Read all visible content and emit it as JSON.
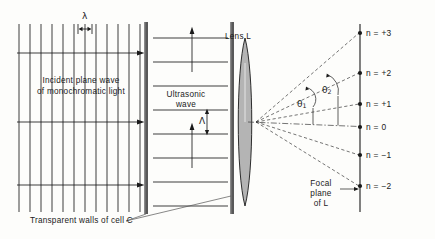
{
  "figure": {
    "background_color": "#fdfdfb",
    "ink_color": "#1a1a1a",
    "wall_color": "#555555",
    "lens_fill": "#b0b0b0"
  },
  "labels": {
    "light_wavelength": "λ",
    "incident_line1": "Incident plane wave",
    "incident_line2": "of monochromatic light",
    "ultrasonic_line1": "Ultrasonic",
    "ultrasonic_line2": "wave",
    "sound_wavelength": "Λ",
    "lens": "Lens L",
    "cell_walls": "Transparent walls of cell C",
    "focal_plane_line1": "Focal",
    "focal_plane_line2": "plane",
    "focal_plane_line3": "of L",
    "theta1": "θ",
    "theta1_sub": "1",
    "theta2": "θ",
    "theta2_sub": "2"
  },
  "diffraction_orders": [
    {
      "label": "n = +3",
      "order": 3,
      "y": 33
    },
    {
      "label": "n = +2",
      "order": 2,
      "y": 73
    },
    {
      "label": "n = +1",
      "order": 1,
      "y": 104
    },
    {
      "label": "n = 0",
      "order": 0,
      "y": 127
    },
    {
      "label": "n = −1",
      "order": -1,
      "y": 155
    },
    {
      "label": "n = −2",
      "order": -2,
      "y": 186
    }
  ],
  "geometry": {
    "light_rays_count": 3,
    "wavefront_lines_count": 12,
    "ultrasonic_wavefront_count": 8,
    "focus_point": {
      "x": 256,
      "y": 122
    },
    "focal_plane_x": 360,
    "cell_left_wall_x": 146,
    "cell_right_wall_x": 232,
    "lens_center_x": 245
  }
}
